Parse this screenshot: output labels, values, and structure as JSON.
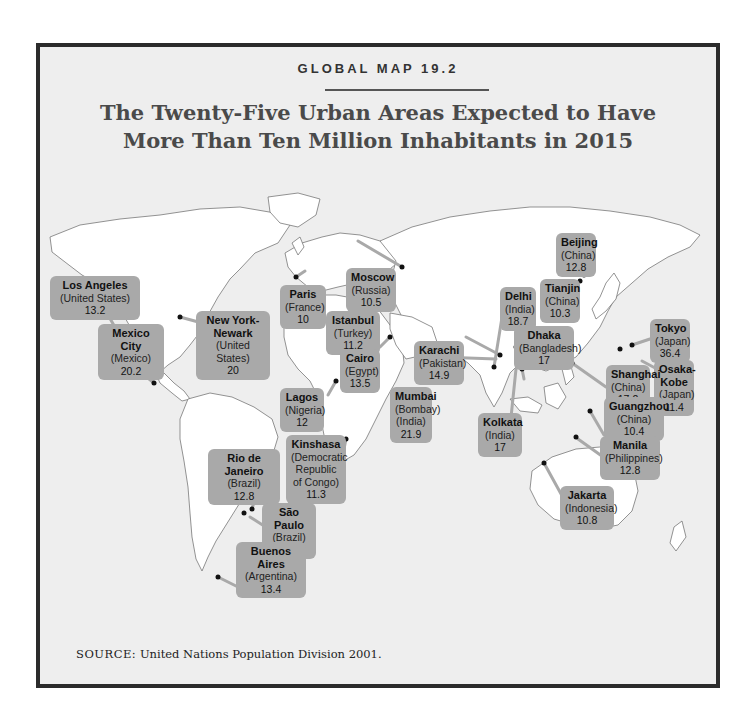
{
  "header": {
    "kicker": "GLOBAL MAP 19.2",
    "title_line1": "The Twenty-Five Urban Areas Expected to Have",
    "title_line2": "More Than Ten Million Inhabitants in 2015"
  },
  "colors": {
    "background": "#eeeeee",
    "land": "#ffffff",
    "label_box": "#a9a9a9",
    "frame": "#2b2b2b",
    "title": "#4a4a4a"
  },
  "cities": [
    {
      "name": "Los Angeles",
      "country": "(United States)",
      "pop": "13.2"
    },
    {
      "name": "Mexico City",
      "country": "(Mexico)",
      "pop": "20.2"
    },
    {
      "name": "New York-Newark",
      "country": "(United States)",
      "pop": "20"
    },
    {
      "name": "Paris",
      "country": "(France)",
      "pop": "10"
    },
    {
      "name": "Moscow",
      "country": "(Russia)",
      "pop": "10.5"
    },
    {
      "name": "Istanbul",
      "country": "(Turkey)",
      "pop": "11.2"
    },
    {
      "name": "Cairo",
      "country": "(Egypt)",
      "pop": "13.5"
    },
    {
      "name": "Karachi",
      "country": "(Pakistan)",
      "pop": "14.9"
    },
    {
      "name": "Mumbai",
      "country": "(Bombay) (India)",
      "pop": "21.9"
    },
    {
      "name": "Lagos",
      "country": "(Nigeria)",
      "pop": "12"
    },
    {
      "name": "Kinshasa",
      "country": "(Democratic Republic of Congo)",
      "pop": "11.3"
    },
    {
      "name": "Rio de Janeiro",
      "country": "(Brazil)",
      "pop": "12.8"
    },
    {
      "name": "São Paulo",
      "country": "(Brazil)",
      "pop": "20.5"
    },
    {
      "name": "Buenos Aires",
      "country": "(Argentina)",
      "pop": "13.4"
    },
    {
      "name": "Delhi",
      "country": "(India)",
      "pop": "18.7"
    },
    {
      "name": "Beijing",
      "country": "(China)",
      "pop": "12.8"
    },
    {
      "name": "Tianjin",
      "country": "(China)",
      "pop": "10.3"
    },
    {
      "name": "Dhaka",
      "country": "(Bangladesh)",
      "pop": "17"
    },
    {
      "name": "Tokyo",
      "country": "(Japan)",
      "pop": "36.4"
    },
    {
      "name": "Osaka-Kobe",
      "country": "(Japan)",
      "pop": "11.4"
    },
    {
      "name": "Shanghai",
      "country": "(China)",
      "pop": "17.2"
    },
    {
      "name": "Guangzhou",
      "country": "(China)",
      "pop": "10.4"
    },
    {
      "name": "Kolkata",
      "country": "(India)",
      "pop": "17"
    },
    {
      "name": "Manila",
      "country": "(Philippines)",
      "pop": "12.8"
    },
    {
      "name": "Jakarta",
      "country": "(Indonesia)",
      "pop": "10.8"
    }
  ],
  "labels_extra": {
    "new_york_line1": "New York-",
    "new_york_line2": "Newark",
    "osaka_line1": "Osaka-",
    "osaka_line2": "Kobe",
    "mumbai_alt": "(Bombay)",
    "mumbai_country": "(India)",
    "kinshasa_c1": "(Democratic",
    "kinshasa_c2": "Republic",
    "kinshasa_c3": "of Congo)"
  },
  "footer": {
    "source_key": "SOURCE:",
    "source_text": "United Nations Population Division 2001."
  }
}
